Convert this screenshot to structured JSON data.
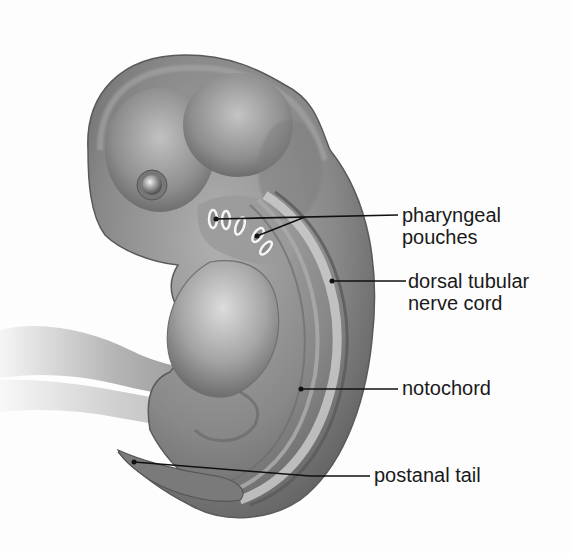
{
  "figure": {
    "colors": {
      "background": "#fdfdfd",
      "embryo_dark": "#5e5e5e",
      "embryo_mid": "#8a8a8a",
      "embryo_light": "#c8c8c8",
      "leader_line": "#111111",
      "text": "#1a1a1a"
    }
  },
  "labels": [
    {
      "id": "pharyngeal-pouches",
      "line1": "pharyngeal",
      "line2": "pouches",
      "x": 402,
      "y": 204
    },
    {
      "id": "dorsal-tubular-nerve-cord",
      "line1": "dorsal tubular",
      "line2": "nerve cord",
      "x": 408,
      "y": 270
    },
    {
      "id": "notochord",
      "line1": "notochord",
      "line2": "",
      "x": 402,
      "y": 373
    },
    {
      "id": "postanal-tail",
      "line1": "postanal tail",
      "line2": "",
      "x": 374,
      "y": 460
    }
  ]
}
